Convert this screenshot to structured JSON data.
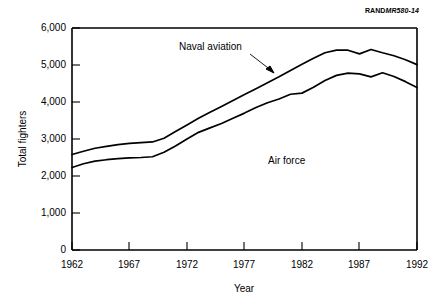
{
  "figure": {
    "source_id_prefix": "RAND",
    "source_id_suffix": "MR580-14"
  },
  "chart_data": {
    "type": "line",
    "title": "",
    "subtitle": "",
    "xlabel": "Year",
    "ylabel": "Total fighters",
    "xlim": [
      1962,
      1992
    ],
    "ylim": [
      0,
      6000
    ],
    "xticks": [
      1962,
      1967,
      1972,
      1977,
      1982,
      1987,
      1992
    ],
    "xticklabels": [
      "1962",
      "1967",
      "1972",
      "1977",
      "1982",
      "1987",
      "1992"
    ],
    "yticks": [
      0,
      1000,
      2000,
      3000,
      4000,
      5000,
      6000
    ],
    "yticklabels": [
      "0",
      "1,000",
      "2,000",
      "3,000",
      "4,000",
      "5,000",
      "6,000"
    ],
    "grid": false,
    "legend": "annotations",
    "x": [
      1962,
      1963,
      1964,
      1965,
      1966,
      1967,
      1968,
      1969,
      1970,
      1971,
      1972,
      1973,
      1974,
      1975,
      1976,
      1977,
      1978,
      1979,
      1980,
      1981,
      1982,
      1983,
      1984,
      1985,
      1986,
      1987,
      1988,
      1989,
      1990,
      1991,
      1992
    ],
    "series": [
      {
        "name": "Naval aviation",
        "note": "Upper boundary: total of Air Force plus naval aviation fighters",
        "values": [
          2580,
          2670,
          2750,
          2800,
          2850,
          2880,
          2900,
          2920,
          3020,
          3200,
          3380,
          3560,
          3720,
          3880,
          4040,
          4200,
          4360,
          4520,
          4680,
          4850,
          5020,
          5180,
          5330,
          5400,
          5400,
          5300,
          5420,
          5330,
          5250,
          5140,
          5010
        ]
      },
      {
        "name": "Air force",
        "note": "Lower boundary: Air Force fighters only",
        "values": [
          2230,
          2330,
          2400,
          2440,
          2470,
          2490,
          2500,
          2520,
          2640,
          2810,
          3000,
          3180,
          3300,
          3420,
          3560,
          3700,
          3850,
          3980,
          4080,
          4210,
          4240,
          4400,
          4580,
          4720,
          4780,
          4760,
          4680,
          4790,
          4690,
          4550,
          4390
        ]
      }
    ],
    "annotations": [
      {
        "text": "Naval aviation",
        "points_to_series": "Naval aviation",
        "arrow": true
      },
      {
        "text": "Air force",
        "points_to_series": "Air force",
        "arrow": false
      }
    ]
  }
}
